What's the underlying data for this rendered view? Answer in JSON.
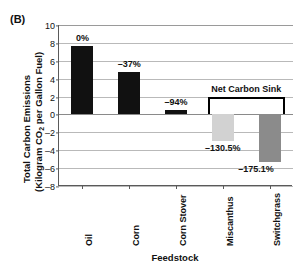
{
  "panel": {
    "label": "(B)"
  },
  "axes": {
    "ylabel_line1": "Total Carbon Emissions",
    "ylabel_line2_pre": "(Kilogram CO",
    "ylabel_line2_sub": "2",
    "ylabel_line2_post": " per Gallon Fuel)",
    "xlabel": "Feedstock"
  },
  "annotation": {
    "net_carbon_sink": "Net Carbon Sink"
  },
  "chart_data": {
    "type": "bar",
    "title": "(B)",
    "xlabel": "Feedstock",
    "ylabel": "Total Carbon Emissions (Kilogram CO2 per Gallon Fuel)",
    "ylim": [
      -8,
      10
    ],
    "yticks": [
      10,
      8,
      6,
      4,
      2,
      0,
      -2,
      -4,
      -6,
      -8
    ],
    "ytick_labels": [
      "10",
      "8",
      "6",
      "4",
      "2",
      "0",
      "–2",
      "–4",
      "–6",
      "–8"
    ],
    "grid": true,
    "legend": "none",
    "categories": [
      "Oil",
      "Corn",
      "Corn Stover",
      "Miscanthus",
      "Switchgrass"
    ],
    "values": [
      7.6,
      4.75,
      0.45,
      -3.0,
      -5.3
    ],
    "data_labels": [
      "0%",
      "–37%",
      "–94%",
      "–130.5%",
      "–175.1%"
    ],
    "bar_colors": [
      "#111111",
      "#111111",
      "#111111",
      "#d2d2d2",
      "#8b8b8b"
    ],
    "annotations": [
      {
        "text": "Net Carbon Sink",
        "covers": [
          "Miscanthus",
          "Switchgrass"
        ]
      }
    ]
  }
}
